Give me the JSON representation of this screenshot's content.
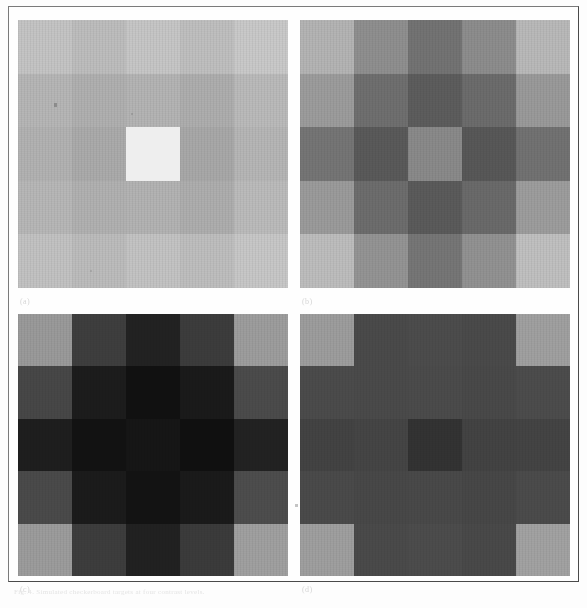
{
  "figure": {
    "kind": "scanned-figure-plate",
    "panel_count": 4,
    "caption": "Fig. 4.  Simulated checkerboard targets at four contrast levels.",
    "frame_color": "#7a7a7a",
    "page_background": "#fdfdfd"
  },
  "panels": [
    {
      "id": "a",
      "label": "(a)",
      "position": "top-left",
      "description": "low-contrast light checkerboard with bright central patch",
      "cells": [
        [
          "#c4c4c4",
          "#bdbdbd",
          "#c6c6c6",
          "#bfbfbf",
          "#c9c9c9"
        ],
        [
          "#b6b6b6",
          "#b0b0b0",
          "#b4b4b4",
          "#aeaeae",
          "#bababa"
        ],
        [
          "#b2b2b2",
          "#ababab",
          "#adadad",
          "#a8a8a8",
          "#b6b6b6"
        ],
        [
          "#b7b7b7",
          "#b1b1b1",
          "#b3b3b3",
          "#aeaeae",
          "#bbbbbb"
        ],
        [
          "#c2c2c2",
          "#bcbcbc",
          "#c3c3c3",
          "#bebebe",
          "#c7c7c7"
        ]
      ],
      "center_patch_color": "#eeeeee",
      "has_center_patch": true
    },
    {
      "id": "b",
      "label": "(b)",
      "position": "top-right",
      "description": "mid-contrast checkerboard, darker toward centre",
      "cells": [
        [
          "#b4b4b4",
          "#8f8f8f",
          "#737373",
          "#8d8d8d",
          "#b9b9b9"
        ],
        [
          "#9c9c9c",
          "#6f6f6f",
          "#5d5d5d",
          "#6c6c6c",
          "#9a9a9a"
        ],
        [
          "#757575",
          "#5a5a5a",
          "#8a8a8a",
          "#585858",
          "#727272"
        ],
        [
          "#9b9b9b",
          "#6d6d6d",
          "#5b5b5b",
          "#6a6a6a",
          "#9d9d9d"
        ],
        [
          "#bdbdbd",
          "#949494",
          "#767676",
          "#929292",
          "#c0c0c0"
        ]
      ],
      "center_patch_color": "#8e8e8e",
      "has_center_patch": false
    },
    {
      "id": "c",
      "label": "(c)",
      "position": "bottom-left",
      "description": "high-contrast dark checkerboard, near-black centre",
      "cells": [
        [
          "#9a9a9a",
          "#3e3e3e",
          "#222222",
          "#3c3c3c",
          "#9d9d9d"
        ],
        [
          "#474747",
          "#1c1c1c",
          "#111111",
          "#1a1a1a",
          "#4b4b4b"
        ],
        [
          "#1e1e1e",
          "#121212",
          "#161616",
          "#101010",
          "#222222"
        ],
        [
          "#4a4a4a",
          "#1b1b1b",
          "#131313",
          "#1a1a1a",
          "#4d4d4d"
        ],
        [
          "#9c9c9c",
          "#3d3d3d",
          "#212121",
          "#3b3b3b",
          "#a0a0a0"
        ]
      ],
      "center_patch_color": "#161616",
      "has_center_patch": false
    },
    {
      "id": "d",
      "label": "(d)",
      "position": "bottom-right",
      "description": "uniform dark field with light corners and dark central square",
      "cells": [
        [
          "#9d9d9d",
          "#4a4a4a",
          "#4c4c4c",
          "#4a4a4a",
          "#a0a0a0"
        ],
        [
          "#4b4b4b",
          "#4a4a4a",
          "#4b4b4b",
          "#494949",
          "#4c4c4c"
        ],
        [
          "#434343",
          "#454545",
          "#333333",
          "#434343",
          "#444444"
        ],
        [
          "#4a4a4a",
          "#484848",
          "#494949",
          "#474747",
          "#4b4b4b"
        ],
        [
          "#9f9f9f",
          "#4a4a4a",
          "#4c4c4c",
          "#494949",
          "#a2a2a2"
        ]
      ],
      "center_patch_color": "#333333",
      "has_center_patch": false
    }
  ]
}
